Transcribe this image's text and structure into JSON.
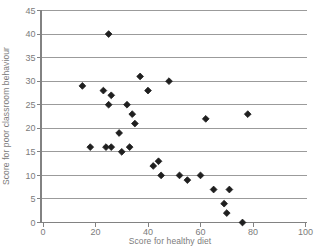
{
  "chart_data": {
    "type": "scatter",
    "title": "",
    "xlabel": "Score for healthy diet",
    "ylabel": "Score for poor classroom behaviour",
    "xlim": [
      0,
      100
    ],
    "ylim": [
      0,
      45
    ],
    "x_ticks": [
      0,
      20,
      40,
      60,
      80,
      100
    ],
    "y_ticks": [
      0,
      5,
      10,
      15,
      20,
      25,
      30,
      35,
      40,
      45
    ],
    "grid": "horizontal-only",
    "legend": "none",
    "marker": "diamond",
    "points": [
      [
        25,
        40
      ],
      [
        37,
        31
      ],
      [
        48,
        30
      ],
      [
        15,
        29
      ],
      [
        23,
        28
      ],
      [
        40,
        28
      ],
      [
        26,
        27
      ],
      [
        25,
        25
      ],
      [
        32,
        25
      ],
      [
        34,
        23
      ],
      [
        78,
        23
      ],
      [
        62,
        22
      ],
      [
        35,
        21
      ],
      [
        29,
        19
      ],
      [
        18,
        16
      ],
      [
        24,
        16
      ],
      [
        26,
        16
      ],
      [
        33,
        16
      ],
      [
        30,
        15
      ],
      [
        44,
        13
      ],
      [
        42,
        12
      ],
      [
        45,
        10
      ],
      [
        52,
        10
      ],
      [
        60,
        10
      ],
      [
        55,
        9
      ],
      [
        65,
        7
      ],
      [
        71,
        7
      ],
      [
        69,
        4
      ],
      [
        70,
        2
      ],
      [
        76,
        0
      ]
    ],
    "colors": {
      "marker": "#1f1f1f",
      "gridline": "#9b9b9b",
      "axis": "#828282",
      "text": "#7b7b7b",
      "background": "#ffffff"
    }
  }
}
